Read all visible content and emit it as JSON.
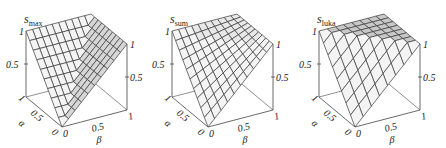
{
  "chart_data": [
    {
      "type": "surface3d",
      "title": "s_max",
      "title_main": "s",
      "title_sub": "max",
      "function": "max(alpha, beta)",
      "xlabel": "α",
      "ylabel": "β",
      "zlabel": "",
      "x_ticks": [
        "0",
        "0.5",
        "1"
      ],
      "y_ticks": [
        "0",
        "0.5",
        "1"
      ],
      "z_ticks": [
        "0.5",
        "1"
      ],
      "xlim": [
        0,
        1
      ],
      "ylim": [
        0,
        1
      ],
      "zlim": [
        0,
        1
      ],
      "grid_n": 10,
      "corner_values": {
        "a0b0": 0,
        "a1b0": 1,
        "a0b1": 1,
        "a1b1": 1
      }
    },
    {
      "type": "surface3d",
      "title": "s_sum",
      "title_main": "s",
      "title_sub": "sum",
      "function": "alpha + beta - alpha*beta",
      "xlabel": "α",
      "ylabel": "β",
      "zlabel": "",
      "x_ticks": [
        "0",
        "0.5",
        "1"
      ],
      "y_ticks": [
        "0",
        "0.5",
        "1"
      ],
      "z_ticks": [
        "0.5",
        "1"
      ],
      "xlim": [
        0,
        1
      ],
      "ylim": [
        0,
        1
      ],
      "zlim": [
        0,
        1
      ],
      "grid_n": 10,
      "corner_values": {
        "a0b0": 0,
        "a1b0": 1,
        "a0b1": 1,
        "a1b1": 1
      }
    },
    {
      "type": "surface3d",
      "title": "s_luka",
      "title_main": "s",
      "title_sub": "luka",
      "function": "min(1, alpha + beta)",
      "xlabel": "α",
      "ylabel": "β",
      "zlabel": "",
      "x_ticks": [
        "0",
        "0.5",
        "1"
      ],
      "y_ticks": [
        "0",
        "0.5",
        "1"
      ],
      "z_ticks": [
        "0.5",
        "1"
      ],
      "xlim": [
        0,
        1
      ],
      "ylim": [
        0,
        1
      ],
      "zlim": [
        0,
        1
      ],
      "grid_n": 8,
      "corner_values": {
        "a0b0": 0,
        "a1b0": 1,
        "a0b1": 1,
        "a1b1": 1
      }
    }
  ],
  "panels": [
    {
      "offset_x": 0,
      "surface_fn": "max"
    },
    {
      "offset_x": 146,
      "surface_fn": "probsum"
    },
    {
      "offset_x": 293,
      "surface_fn": "luka"
    }
  ],
  "colors": {
    "line": "#3a3a3a",
    "axis": "#444444",
    "face_light": "#f4f4f4",
    "face_shade": "#d6d6d6",
    "face_mid": "#e8e8e8",
    "face_flat": "#c8c8c8"
  }
}
